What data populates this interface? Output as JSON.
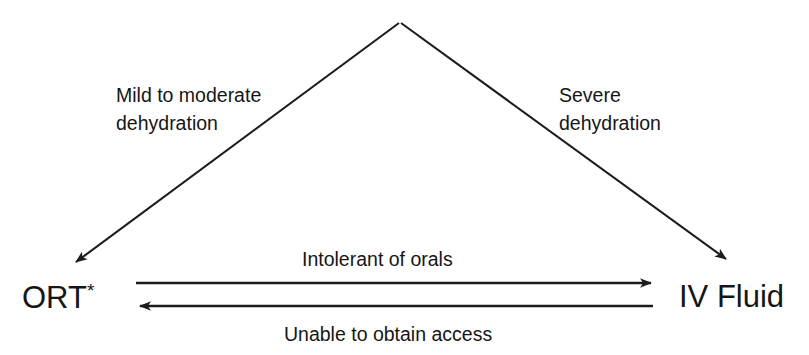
{
  "diagram": {
    "background_color": "#ffffff",
    "stroke_color": "#1c1c1c",
    "text_color": "#161616",
    "nodes": [
      {
        "id": "ort",
        "label": "ORT",
        "superscript": "*",
        "position": "bottom-left"
      },
      {
        "id": "iv_fluid",
        "label": "IV Fluid",
        "superscript": "",
        "position": "bottom-right"
      }
    ],
    "edges": [
      {
        "id": "apex-to-ort",
        "label_line1": "Mild to moderate",
        "label_line2": "dehydration",
        "from": "apex",
        "to": "ort",
        "arrowhead": "end"
      },
      {
        "id": "apex-to-iv",
        "label_line1": "Severe",
        "label_line2": "dehydration",
        "from": "apex",
        "to": "iv_fluid",
        "arrowhead": "end"
      },
      {
        "id": "ort-to-iv",
        "label_line1": "Intolerant of orals",
        "label_line2": "",
        "from": "ort",
        "to": "iv_fluid",
        "arrowhead": "end"
      },
      {
        "id": "iv-to-ort",
        "label_line1": "Unable to obtain access",
        "label_line2": "",
        "from": "iv_fluid",
        "to": "ort",
        "arrowhead": "end"
      }
    ]
  }
}
